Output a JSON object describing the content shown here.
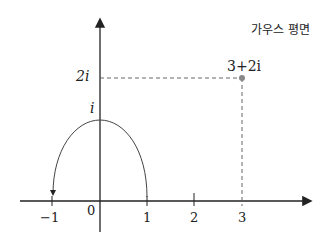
{
  "title": "가우스 평면",
  "axis_labels": {
    "origin": "0",
    "x_ticks": [
      "−1",
      "1",
      "2",
      "3"
    ],
    "y_labels": [
      "i",
      "2i"
    ]
  },
  "point": {
    "label": "3+2i",
    "re": 3,
    "im": 2
  },
  "arc": {
    "from": "1",
    "to": "−1",
    "through": "i",
    "direction": "counterclockwise"
  },
  "colors": {
    "axis": "#222222",
    "point": "#888888",
    "dashed": "#555555"
  }
}
